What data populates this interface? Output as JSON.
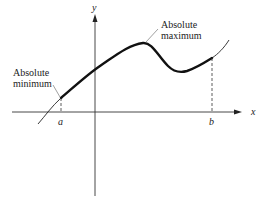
{
  "diagram": {
    "type": "function-graph",
    "axes": {
      "x_label": "x",
      "y_label": "y"
    },
    "points": {
      "a_label": "a",
      "b_label": "b"
    },
    "annotations": {
      "absolute_minimum_line1": "Absolute",
      "absolute_minimum_line2": "minimum",
      "absolute_maximum_line1": "Absolute",
      "absolute_maximum_line2": "maximum"
    },
    "colors": {
      "curve": "#1a1a1a",
      "axes": "#333333",
      "background": "#ffffff"
    }
  }
}
